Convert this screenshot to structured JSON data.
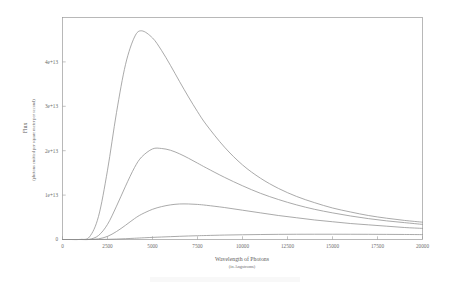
{
  "figure": {
    "name": "blackbody-flux-plot",
    "background_color": "#ffffff",
    "line_color": "#8d8d8d",
    "axis_color": "#9a9a9a"
  },
  "chart_data": {
    "type": "line",
    "title": "",
    "xlabel": "Wavelength of Photons",
    "xlabel_sub": "(in Angstroms)",
    "ylabel": "Flux",
    "ylabel_sub": "(photons emitted per square meter per second)",
    "xlim": [
      0,
      20000
    ],
    "ylim": [
      0,
      50000000000000
    ],
    "grid": false,
    "legend": "none",
    "xticks": [
      0,
      2500,
      5000,
      7500,
      10000,
      12500,
      15000,
      17500,
      20000
    ],
    "xtick_labels": [
      "0",
      "2500",
      "5000",
      "7500",
      "10000",
      "12500",
      "15000",
      "17500",
      "20000"
    ],
    "yticks": [
      0,
      10000000000000,
      20000000000000,
      30000000000000,
      40000000000000
    ],
    "ytick_labels": [
      "0",
      "1e+13",
      "2e+13",
      "3e+13",
      "4e+13"
    ],
    "x": [
      0,
      500,
      1000,
      1500,
      2000,
      2500,
      3000,
      3500,
      4000,
      4400,
      5000,
      5500,
      6000,
      6500,
      7000,
      7500,
      8000,
      9000,
      10000,
      11000,
      12000,
      13000,
      14000,
      15000,
      16000,
      17000,
      18000,
      19000,
      20000
    ],
    "series": [
      {
        "name": "curve-1",
        "peak_x": 4400,
        "peak_y": 47000000000000,
        "values": [
          0,
          0,
          0.02,
          0.6,
          5.2,
          15.6,
          28.6,
          39.4,
          45.6,
          47.0,
          45.4,
          42.6,
          39.2,
          35.6,
          32.1,
          28.8,
          25.8,
          20.8,
          16.8,
          13.8,
          11.5,
          9.7,
          8.3,
          7.1,
          6.2,
          5.4,
          4.8,
          4.3,
          3.9
        ],
        "value_scale": 1000000000000
      },
      {
        "name": "curve-2",
        "peak_x": 5100,
        "peak_y": 20500000000000,
        "values": [
          0,
          0,
          0,
          0.05,
          0.9,
          3.4,
          7.5,
          12.0,
          16.2,
          18.6,
          20.4,
          20.5,
          20.1,
          19.3,
          18.3,
          17.2,
          16.1,
          14.0,
          12.1,
          10.4,
          9.0,
          7.8,
          6.8,
          6.0,
          5.3,
          4.7,
          4.2,
          3.8,
          3.4
        ],
        "value_scale": 1000000000000
      },
      {
        "name": "curve-3",
        "peak_x": 6400,
        "peak_y": 8000000000000,
        "values": [
          0,
          0,
          0,
          0.01,
          0.15,
          0.7,
          1.8,
          3.2,
          4.7,
          5.7,
          6.8,
          7.4,
          7.8,
          8.0,
          8.0,
          7.9,
          7.7,
          7.2,
          6.6,
          6.0,
          5.4,
          4.9,
          4.4,
          4.0,
          3.6,
          3.3,
          3.0,
          2.7,
          2.5
        ],
        "value_scale": 1000000000000
      },
      {
        "name": "curve-4",
        "peak_x": 12500,
        "peak_y": 1200000000000,
        "values": [
          0,
          0,
          0,
          0,
          0.01,
          0.04,
          0.1,
          0.18,
          0.28,
          0.36,
          0.48,
          0.56,
          0.64,
          0.72,
          0.79,
          0.85,
          0.9,
          1.0,
          1.07,
          1.12,
          1.16,
          1.18,
          1.19,
          1.19,
          1.18,
          1.17,
          1.15,
          1.13,
          1.1
        ],
        "value_scale": 1000000000000
      }
    ]
  }
}
